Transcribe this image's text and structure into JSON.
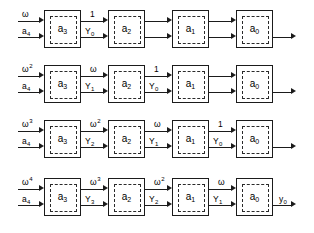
{
  "diagram": {
    "type": "block-diagram",
    "background_color": "#ffffff",
    "line_color": "#1b1b1b",
    "rows": [
      {
        "id": "row-1",
        "inputs": {
          "upper": "ω",
          "upper_sup": "",
          "lower": "a",
          "lower_sub": "4"
        },
        "cells": [
          {
            "label": "a",
            "sub": "3"
          },
          {
            "label": "a",
            "sub": "2"
          },
          {
            "label": "a",
            "sub": "1"
          },
          {
            "label": "a",
            "sub": "0"
          }
        ],
        "links": [
          {
            "upper": "1",
            "upper_sup": "",
            "lower": "Y",
            "lower_sub": "0"
          },
          {
            "upper": "",
            "upper_sup": "",
            "lower": "",
            "lower_sub": ""
          },
          {
            "upper": "",
            "upper_sup": "",
            "lower": "",
            "lower_sub": ""
          }
        ],
        "output": {
          "label": "",
          "sub": ""
        }
      },
      {
        "id": "row-2",
        "inputs": {
          "upper": "ω",
          "upper_sup": "2",
          "lower": "a",
          "lower_sub": "4"
        },
        "cells": [
          {
            "label": "a",
            "sub": "3"
          },
          {
            "label": "a",
            "sub": "2"
          },
          {
            "label": "a",
            "sub": "1"
          },
          {
            "label": "a",
            "sub": "0"
          }
        ],
        "links": [
          {
            "upper": "ω",
            "upper_sup": "",
            "lower": "Y",
            "lower_sub": "1"
          },
          {
            "upper": "1",
            "upper_sup": "",
            "lower": "Y",
            "lower_sub": "0"
          },
          {
            "upper": "",
            "upper_sup": "",
            "lower": "",
            "lower_sub": ""
          }
        ],
        "output": {
          "label": "",
          "sub": ""
        }
      },
      {
        "id": "row-3",
        "inputs": {
          "upper": "ω",
          "upper_sup": "3",
          "lower": "a",
          "lower_sub": "4"
        },
        "cells": [
          {
            "label": "a",
            "sub": "3"
          },
          {
            "label": "a",
            "sub": "2"
          },
          {
            "label": "a",
            "sub": "1"
          },
          {
            "label": "a",
            "sub": "0"
          }
        ],
        "links": [
          {
            "upper": "ω",
            "upper_sup": "2",
            "lower": "Y",
            "lower_sub": "2"
          },
          {
            "upper": "ω",
            "upper_sup": "",
            "lower": "Y",
            "lower_sub": "1"
          },
          {
            "upper": "1",
            "upper_sup": "",
            "lower": "Y",
            "lower_sub": "0"
          }
        ],
        "output": {
          "label": "",
          "sub": ""
        }
      },
      {
        "id": "row-4",
        "inputs": {
          "upper": "ω",
          "upper_sup": "4",
          "lower": "a",
          "lower_sub": "4"
        },
        "cells": [
          {
            "label": "a",
            "sub": "3"
          },
          {
            "label": "a",
            "sub": "2"
          },
          {
            "label": "a",
            "sub": "1"
          },
          {
            "label": "a",
            "sub": "0"
          }
        ],
        "links": [
          {
            "upper": "ω",
            "upper_sup": "3",
            "lower": "Y",
            "lower_sub": "3"
          },
          {
            "upper": "ω",
            "upper_sup": "2",
            "lower": "Y",
            "lower_sub": "2"
          },
          {
            "upper": "ω",
            "upper_sup": "",
            "lower": "Y",
            "lower_sub": "1"
          }
        ],
        "output": {
          "label": "y",
          "sub": "0"
        }
      }
    ]
  }
}
